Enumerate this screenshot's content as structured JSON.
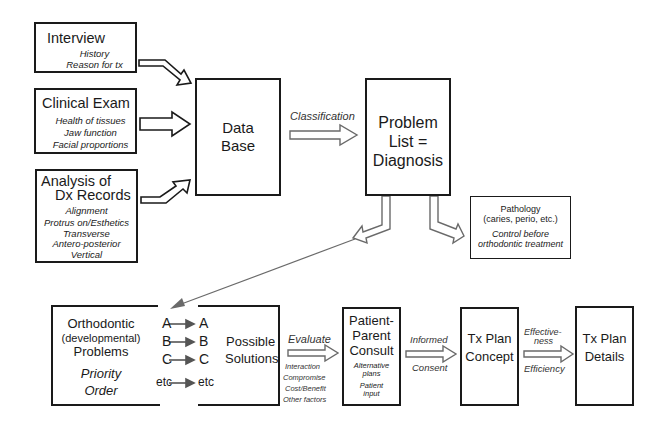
{
  "inputs": {
    "interview": {
      "title": "Interview",
      "items": [
        "History",
        "Reason for tx"
      ]
    },
    "clinical_exam": {
      "title": "Clinical Exam",
      "items": [
        "Health of tissues",
        "Jaw function",
        "Facial proportions"
      ]
    },
    "analysis": {
      "title_line1": "Analysis of",
      "title_line2": "Dx Records",
      "items": [
        "Alignment",
        "Protrus on/Esthetics",
        "Transverse",
        "Antero-posterior",
        "Vertical"
      ]
    }
  },
  "database": {
    "line1": "Data",
    "line2": "Base"
  },
  "classification_label": "Classification",
  "problem_list": {
    "line1": "Problem",
    "line2": "List =",
    "line3": "Diagnosis"
  },
  "pathology": {
    "line1": "Pathology",
    "line2": "(caries, perio, etc.)",
    "note_line1": "Control before",
    "note_line2": "orthodontic treatment"
  },
  "problems": {
    "line1": "Orthodontic",
    "line2": "(developmental)",
    "line3": "Problems",
    "priority_line1": "Priority",
    "priority_line2": "Order",
    "rows": [
      {
        "from": "A",
        "to": "A"
      },
      {
        "from": "B",
        "to": "B"
      },
      {
        "from": "C",
        "to": "C"
      },
      {
        "from": "etc",
        "to": "etc"
      }
    ],
    "solutions_line1": "Possible",
    "solutions_line2": "Solutions"
  },
  "evaluate": {
    "label": "Evaluate",
    "factors": [
      "Interaction",
      "Compromise",
      "Cost/Benefit",
      "Other factors"
    ]
  },
  "consult": {
    "line1": "Patient-",
    "line2": "Parent",
    "line3": "Consult",
    "notes": [
      "Alternative",
      "plans",
      "Patient",
      "input"
    ]
  },
  "consent": {
    "top": "Informed",
    "bottom": "Consent"
  },
  "concept": {
    "line1": "Tx Plan",
    "line2": "Concept"
  },
  "effectiveness": {
    "top1": "Effective-",
    "top2": "ness",
    "bottom": "Efficiency"
  },
  "details": {
    "line1": "Tx Plan",
    "line2": "Details"
  }
}
